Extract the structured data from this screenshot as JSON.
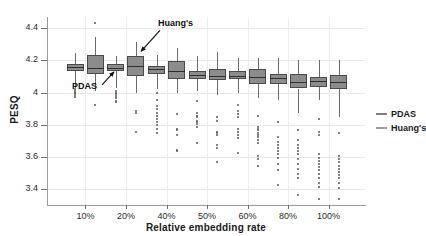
{
  "chart_data": {
    "type": "box",
    "title": "",
    "xlabel": "Relative embedding rate",
    "ylabel": "PESQ",
    "categories": [
      "10%",
      "20%",
      "40%",
      "50%",
      "60%",
      "80%",
      "100%"
    ],
    "ylim": [
      3.3,
      4.47
    ],
    "yticks": [
      4.4,
      4.2,
      4,
      3.8,
      3.6,
      3.4
    ],
    "ytick_labels": [
      "4.4",
      "4.2",
      "4",
      "3.8",
      "3.6",
      "3.4"
    ],
    "grid": true,
    "legend_position": "right",
    "legend": [
      "PDAS",
      "Huang's"
    ],
    "annotations": [
      {
        "text": "PDAS",
        "target_series": "PDAS",
        "target_category": "20%"
      },
      {
        "text": "Huang's",
        "target_series": "Huang's",
        "target_category": "20%"
      }
    ],
    "series": [
      {
        "name": "PDAS",
        "color": "#8c8c8c",
        "boxes": [
          {
            "category": "10%",
            "whisker_low": 4.03,
            "q1": 4.135,
            "median": 4.157,
            "q3": 4.175,
            "whisker_high": 4.245,
            "outliers": [
              4.02,
              4.01,
              4.0,
              3.995,
              3.985,
              3.975
            ]
          },
          {
            "category": "20%",
            "whisker_low": 4.03,
            "q1": 4.135,
            "median": 4.155,
            "q3": 4.175,
            "whisker_high": 4.225,
            "outliers": [
              4.01,
              4.0,
              3.99,
              3.98,
              3.965,
              3.95,
              3.94
            ]
          },
          {
            "category": "40%",
            "whisker_low": 4.02,
            "q1": 4.115,
            "median": 4.145,
            "q3": 4.165,
            "whisker_high": 4.235,
            "outliers": [
              4.0,
              3.955,
              3.915,
              3.895,
              3.875,
              3.855,
              3.835,
              3.815,
              3.795,
              3.775,
              3.745
            ]
          },
          {
            "category": "50%",
            "whisker_low": 4.01,
            "q1": 4.085,
            "median": 4.11,
            "q3": 4.135,
            "whisker_high": 4.225,
            "outliers": [
              3.95,
              3.875,
              3.855,
              3.845,
              3.825,
              3.815,
              3.805,
              3.785,
              3.685
            ]
          },
          {
            "category": "60%",
            "whisker_low": 4.0,
            "q1": 4.085,
            "median": 4.105,
            "q3": 4.135,
            "whisker_high": 4.215,
            "outliers": [
              3.925,
              3.885,
              3.865,
              3.845,
              3.775,
              3.755,
              3.735,
              3.715,
              3.625
            ]
          },
          {
            "category": "80%",
            "whisker_low": 3.955,
            "q1": 4.055,
            "median": 4.09,
            "q3": 4.115,
            "whisker_high": 4.215,
            "outliers": [
              3.815,
              3.725,
              3.695,
              3.675,
              3.655,
              3.635,
              3.615,
              3.595,
              3.555,
              3.515,
              3.425
            ]
          },
          {
            "category": "100%",
            "whisker_low": 3.955,
            "q1": 4.035,
            "median": 4.07,
            "q3": 4.095,
            "whisker_high": 4.205,
            "outliers": [
              3.835,
              3.755,
              3.735,
              3.615,
              3.595,
              3.575,
              3.555,
              3.535,
              3.515,
              3.495,
              3.465,
              3.435,
              3.415,
              3.335
            ]
          }
        ]
      },
      {
        "name": "Huang's",
        "color": "#8c8c8c",
        "boxes": [
          {
            "category": "10%",
            "whisker_low": 4.01,
            "q1": 4.115,
            "median": 4.155,
            "q3": 4.235,
            "whisker_high": 4.345,
            "outliers": [
              4.435,
              3.925
            ]
          },
          {
            "category": "20%",
            "whisker_low": 4.0,
            "q1": 4.105,
            "median": 4.165,
            "q3": 4.225,
            "whisker_high": 4.315,
            "outliers": [
              3.885,
              3.875,
              3.755
            ]
          },
          {
            "category": "40%",
            "whisker_low": 4.0,
            "q1": 4.085,
            "median": 4.135,
            "q3": 4.195,
            "whisker_high": 4.275,
            "outliers": [
              3.865,
              3.775,
              3.765,
              3.735,
              3.645,
              3.635
            ]
          },
          {
            "category": "50%",
            "whisker_low": 3.985,
            "q1": 4.075,
            "median": 4.105,
            "q3": 4.145,
            "whisker_high": 4.255,
            "outliers": [
              3.845,
              3.825,
              3.755,
              3.745,
              3.735,
              3.675,
              3.655,
              3.565
            ]
          },
          {
            "category": "60%",
            "whisker_low": 3.965,
            "q1": 4.055,
            "median": 4.095,
            "q3": 4.145,
            "whisker_high": 4.215,
            "outliers": [
              3.855,
              3.785,
              3.775,
              3.765,
              3.745,
              3.735,
              3.725,
              3.705,
              3.685,
              3.605,
              3.585,
              3.545
            ]
          },
          {
            "category": "80%",
            "whisker_low": 3.875,
            "q1": 4.025,
            "median": 4.065,
            "q3": 4.115,
            "whisker_high": 4.205,
            "outliers": [
              3.765,
              3.705,
              3.675,
              3.655,
              3.635,
              3.615,
              3.585,
              3.555,
              3.525,
              3.495,
              3.465,
              3.365
            ]
          },
          {
            "category": "100%",
            "whisker_low": 3.845,
            "q1": 4.025,
            "median": 4.065,
            "q3": 4.11,
            "whisker_high": 4.205,
            "outliers": [
              3.745,
              3.605,
              3.585,
              3.565,
              3.545,
              3.525,
              3.505,
              3.485,
              3.465,
              3.435,
              3.405,
              3.335
            ]
          }
        ]
      }
    ]
  }
}
